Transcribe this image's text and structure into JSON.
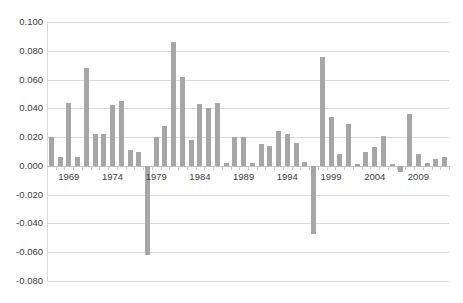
{
  "chart_data": {
    "type": "bar",
    "title": "",
    "subtitle": "",
    "xlabel": "",
    "ylabel": "",
    "ylim": [
      -0.08,
      0.1
    ],
    "ytick_step": 0.02,
    "yticks": [
      0.1,
      0.08,
      0.06,
      0.04,
      0.02,
      0.0,
      -0.02,
      -0.04,
      -0.06,
      -0.08
    ],
    "ytick_labels": [
      "0.100",
      "0.080",
      "0.060",
      "0.040",
      "0.020",
      "0.000",
      "-0.020",
      "-0.040",
      "-0.060",
      "-0.080"
    ],
    "xtick_labels": [
      "1969",
      "1974",
      "1979",
      "1984",
      "1989",
      "1994",
      "1999",
      "2004",
      "2009"
    ],
    "xtick_values": [
      1969,
      1974,
      1979,
      1984,
      1989,
      1994,
      1999,
      2004,
      2009
    ],
    "xlim": [
      1966.5,
      2012.5
    ],
    "grid": true,
    "legend": false,
    "legend_position": "none",
    "bar_color": "#a6a6a6",
    "grid_color": "#d9d9d9",
    "series_name": "",
    "categories": [
      1967,
      1968,
      1969,
      1970,
      1971,
      1972,
      1973,
      1974,
      1975,
      1976,
      1977,
      1978,
      1979,
      1980,
      1981,
      1982,
      1983,
      1984,
      1985,
      1986,
      1987,
      1988,
      1989,
      1990,
      1991,
      1992,
      1993,
      1994,
      1995,
      1996,
      1997,
      1998,
      1999,
      2000,
      2001,
      2002,
      2003,
      2004,
      2005,
      2006,
      2007,
      2008,
      2009,
      2010,
      2011,
      2012
    ],
    "values": [
      0.02,
      0.006,
      0.044,
      0.006,
      0.068,
      0.022,
      0.022,
      0.042,
      0.045,
      0.011,
      0.01,
      -0.062,
      0.02,
      0.028,
      0.086,
      0.062,
      0.018,
      0.043,
      0.04,
      0.044,
      0.002,
      0.02,
      0.02,
      0.002,
      0.015,
      0.014,
      0.024,
      0.022,
      0.016,
      0.003,
      -0.047,
      0.076,
      0.034,
      0.008,
      0.029,
      0.001,
      0.01,
      0.013,
      0.021,
      0.001,
      -0.004,
      0.036,
      0.008,
      0.002,
      0.005,
      0.006
    ]
  }
}
